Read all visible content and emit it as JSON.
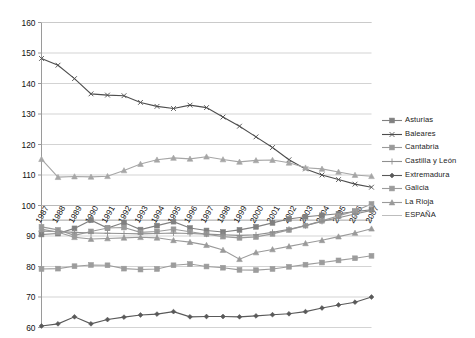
{
  "chart_data": {
    "type": "line",
    "title": "",
    "subtitle": "",
    "xlabel": "",
    "ylabel": "",
    "ylim": [
      60,
      160
    ],
    "ytick_step": 10,
    "yticks": [
      60,
      70,
      80,
      90,
      100,
      110,
      120,
      130,
      140,
      150,
      160
    ],
    "grid": true,
    "grid_axis": "y",
    "legend_position": "right",
    "x": [
      1987,
      1988,
      1989,
      1990,
      1991,
      1992,
      1993,
      1994,
      1995,
      1996,
      1997,
      1998,
      1999,
      2000,
      2001,
      2002,
      2003,
      2004,
      2005,
      2006,
      2007
    ],
    "categories": [
      "1987",
      "1988",
      "1989",
      "1990",
      "1991",
      "1992",
      "1993",
      "1994",
      "1995",
      "1996",
      "1997",
      "1998",
      "1999",
      "2000",
      "2001",
      "2002",
      "2003",
      "2004",
      "2005",
      "2006",
      "2007"
    ],
    "series": [
      {
        "name": "Asturias",
        "color": "#808080",
        "marker": "square",
        "values": [
          90.5,
          90.8,
          92.5,
          95.2,
          92.6,
          94.4,
          92.1,
          93.4,
          94.7,
          92.6,
          91.8,
          91.3,
          92.0,
          93.0,
          94.3,
          95.6,
          96.3,
          96.8,
          97.3,
          98.0,
          98.6
        ]
      },
      {
        "name": "Baleares",
        "color": "#4d4d4d",
        "marker": "cross",
        "values": [
          148.2,
          146.0,
          141.6,
          136.6,
          136.2,
          136.0,
          133.8,
          132.5,
          131.8,
          132.9,
          132.1,
          129.0,
          126.0,
          122.5,
          119.0,
          115.0,
          112.0,
          110.0,
          108.5,
          107.0,
          106.0
        ]
      },
      {
        "name": "Cantabria",
        "color": "#9a9a9a",
        "marker": "square",
        "values": [
          93.0,
          92.0,
          90.2,
          91.5,
          92.6,
          92.8,
          91.2,
          91.5,
          92.2,
          91.4,
          90.6,
          89.8,
          89.4,
          89.7,
          90.7,
          92.0,
          93.4,
          95.0,
          96.6,
          98.2,
          100.5
        ]
      },
      {
        "name": "Castilla y León",
        "color": "#8f8f8f",
        "marker": "plus",
        "values": [
          91.6,
          91.5,
          91.2,
          91.0,
          90.9,
          90.8,
          90.7,
          90.8,
          91.0,
          90.8,
          90.6,
          90.4,
          90.2,
          90.4,
          91.2,
          92.2,
          93.4,
          94.8,
          96.0,
          97.2,
          98.4
        ]
      },
      {
        "name": "Extremadura",
        "color": "#595959",
        "marker": "diamond",
        "values": [
          60.5,
          61.2,
          63.5,
          61.2,
          62.6,
          63.4,
          64.1,
          64.4,
          65.2,
          63.5,
          63.6,
          63.6,
          63.5,
          63.8,
          64.2,
          64.5,
          65.2,
          66.4,
          67.4,
          68.3,
          70.0
        ]
      },
      {
        "name": "Galicia",
        "color": "#9c9c9c",
        "marker": "square",
        "values": [
          79.2,
          79.3,
          80.1,
          80.5,
          80.4,
          79.3,
          79.0,
          79.2,
          80.4,
          80.8,
          80.0,
          79.6,
          78.9,
          78.8,
          79.2,
          79.9,
          80.6,
          81.3,
          82.0,
          82.7,
          83.5
        ]
      },
      {
        "name": "La Rioja",
        "color": "#9a9a9a",
        "marker": "triangle",
        "values": [
          92.3,
          91.2,
          89.6,
          89.0,
          89.2,
          89.4,
          89.6,
          89.4,
          88.6,
          88.0,
          87.0,
          85.4,
          82.4,
          84.6,
          85.6,
          86.6,
          87.6,
          88.6,
          89.8,
          91.0,
          92.4
        ]
      },
      {
        "name": "ESPAÑA",
        "color": "#b5b5b5",
        "marker": "none",
        "values": [
          100,
          100,
          100,
          100,
          100,
          100,
          100,
          100,
          100,
          100,
          100,
          100,
          100,
          100,
          100,
          100,
          100,
          100,
          100,
          100,
          100
        ]
      },
      {
        "name": "Cantabria-upper",
        "color": "#a6a6a6",
        "marker": "triangle",
        "hidden_from_legend": true,
        "values": [
          115.2,
          109.3,
          109.5,
          109.4,
          109.6,
          111.5,
          113.6,
          115.0,
          115.6,
          115.3,
          116.0,
          115.1,
          114.3,
          114.8,
          114.9,
          114.0,
          112.4,
          112.0,
          111.0,
          110.0,
          109.6
        ]
      }
    ],
    "legend_entries": [
      {
        "label": "Asturias",
        "color": "#808080",
        "marker": "square"
      },
      {
        "label": "Baleares",
        "color": "#4d4d4d",
        "marker": "cross"
      },
      {
        "label": "Cantabria",
        "color": "#9a9a9a",
        "marker": "square"
      },
      {
        "label": "Castilla y León",
        "color": "#8f8f8f",
        "marker": "plus"
      },
      {
        "label": "Extremadura",
        "color": "#595959",
        "marker": "diamond"
      },
      {
        "label": "Galicia",
        "color": "#9c9c9c",
        "marker": "square"
      },
      {
        "label": "La Rioja",
        "color": "#9a9a9a",
        "marker": "triangle"
      },
      {
        "label": "ESPAÑA",
        "color": "#b5b5b5",
        "marker": "none"
      }
    ]
  },
  "axes": {
    "y_tick_labels": [
      "160",
      "150",
      "140",
      "130",
      "120",
      "110",
      "100",
      "90",
      "80",
      "70",
      "60"
    ],
    "x_tick_labels": [
      "1987",
      "1988",
      "1989",
      "1990",
      "1991",
      "1992",
      "1993",
      "1994",
      "1995",
      "1996",
      "1997",
      "1998",
      "1999",
      "2000",
      "2001",
      "2002",
      "2003",
      "2004",
      "2005",
      "2006",
      "2007"
    ]
  }
}
